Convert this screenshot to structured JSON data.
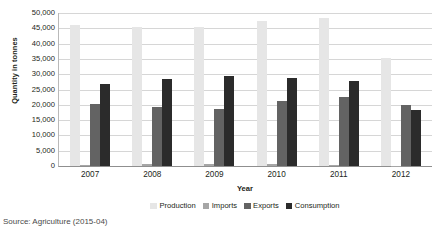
{
  "chart_data": {
    "type": "bar",
    "title": "",
    "xlabel": "Year",
    "ylabel": "Quantity in tonnes",
    "categories": [
      "2007",
      "2008",
      "2009",
      "2010",
      "2011",
      "2012"
    ],
    "ylim": [
      0,
      50000
    ],
    "ytick_step": 5000,
    "ytick_labels": [
      "0",
      "5,000",
      "10,000",
      "15,000",
      "20,000",
      "25,000",
      "30,000",
      "35,000",
      "40,000",
      "45,000",
      "50,000"
    ],
    "ytick_values": [
      0,
      5000,
      10000,
      15000,
      20000,
      25000,
      30000,
      35000,
      40000,
      45000,
      50000
    ],
    "grid": true,
    "grid_axis": "y",
    "legend_position": "bottom",
    "series": [
      {
        "name": "Production",
        "color": "#e6e6e6",
        "values": [
          46000,
          45500,
          45500,
          47500,
          48500,
          35200
        ]
      },
      {
        "name": "Imports",
        "color": "#a6a6a6",
        "values": [
          300,
          700,
          800,
          500,
          300,
          0
        ]
      },
      {
        "name": "Exports",
        "color": "#636363",
        "values": [
          20200,
          19200,
          18700,
          21300,
          22500,
          19800
        ]
      },
      {
        "name": "Consumption",
        "color": "#2b2b2b",
        "values": [
          26700,
          28400,
          29300,
          28900,
          27800,
          18400
        ]
      }
    ]
  },
  "source_note": "Source: Agriculture (2015-04)"
}
